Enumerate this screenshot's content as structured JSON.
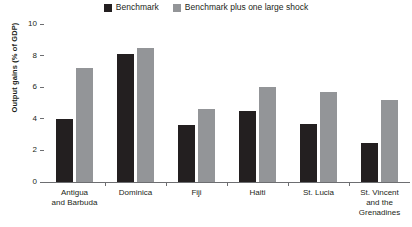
{
  "chart_data": {
    "type": "bar",
    "title": "",
    "xlabel": "",
    "ylabel": "Output gains (% of GDP)",
    "ylim": [
      0,
      10
    ],
    "yticks": [
      0,
      2,
      4,
      6,
      8,
      10
    ],
    "grid": false,
    "legend_position": "top-center",
    "categories": [
      "Antigua and Barbuda",
      "Dominica",
      "Fiji",
      "Haiti",
      "St. Lucia",
      "St. Vincent and the Grenadines"
    ],
    "category_lines": [
      [
        "Antigua",
        "and Barbuda"
      ],
      [
        "Dominica"
      ],
      [
        "Fiji"
      ],
      [
        "Haiti"
      ],
      [
        "St. Lucia"
      ],
      [
        "St. Vincent",
        "and the",
        "Grenadines"
      ]
    ],
    "series": [
      {
        "name": "Benchmark",
        "color": "#231f20",
        "values": [
          4.0,
          8.1,
          3.6,
          4.5,
          3.7,
          2.5
        ]
      },
      {
        "name": "Benchmark plus one large shock",
        "color": "#939598",
        "values": [
          7.2,
          8.5,
          4.6,
          6.0,
          5.7,
          5.2
        ]
      }
    ]
  },
  "legend": {
    "entries": [
      {
        "label": "Benchmark",
        "color": "#231f20"
      },
      {
        "label": "Benchmark plus one large shock",
        "color": "#939598"
      }
    ]
  },
  "axis": {
    "y_title": "Output gains (% of GDP)",
    "y_tick_labels": [
      "10",
      "8",
      "6",
      "4",
      "2",
      "0"
    ]
  },
  "colors": {
    "benchmark": "#231f20",
    "benchmark_shock": "#939598",
    "axis": "#6d6e71",
    "background": "#ffffff"
  }
}
